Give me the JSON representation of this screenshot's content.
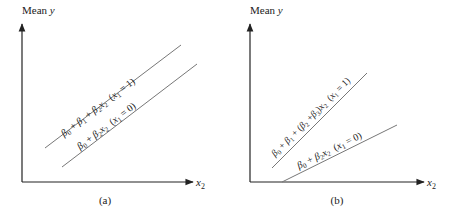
{
  "panels": [
    {
      "id": "a",
      "caption": "(a)",
      "y_axis_label": "Mean",
      "y_axis_var": "y",
      "x_axis_var": "x",
      "x_axis_sub": "2",
      "lines": [
        {
          "name": "x1-equals-1",
          "label_parts": [
            "β",
            "0",
            " + ",
            "β",
            "1",
            " + ",
            "β",
            "2",
            "x",
            "2",
            "  (",
            "x",
            "1",
            " = 1)"
          ],
          "x1": 45,
          "y1": 148,
          "x2": 181,
          "y2": 45
        },
        {
          "name": "x1-equals-0",
          "label_parts": [
            "β",
            "0",
            " + ",
            "β",
            "2",
            "x",
            "2",
            "  (",
            "x",
            "1",
            " = 0)"
          ],
          "x1": 62,
          "y1": 167,
          "x2": 197,
          "y2": 64
        }
      ]
    },
    {
      "id": "b",
      "caption": "(b)",
      "y_axis_label": "Mean",
      "y_axis_var": "y",
      "x_axis_var": "x",
      "x_axis_sub": "2",
      "lines": [
        {
          "name": "x1-equals-1",
          "label_parts": [
            "β",
            "0",
            " + ",
            "β",
            "1",
            " + (",
            "β",
            "2",
            " +",
            "β",
            "3",
            ")",
            "x",
            "2",
            "  (",
            "x",
            "1",
            " = 1)"
          ],
          "x1": 272,
          "y1": 168,
          "x2": 367,
          "y2": 73
        },
        {
          "name": "x1-equals-0",
          "label_parts": [
            "β",
            "0",
            " + ",
            "β",
            "2",
            "x",
            "2",
            "  (",
            "x",
            "1",
            " = 0)"
          ],
          "x1": 282,
          "y1": 182,
          "x2": 397,
          "y2": 125
        }
      ]
    }
  ],
  "labels": {
    "a_upper": {
      "b0": "β",
      "s0": "0",
      "plus1": " + ",
      "b1": "β",
      "s1": "1",
      "plus2": " + ",
      "b2": "β",
      "s2": "2",
      "x": "x",
      "sx": "2",
      "cond_open": "  (",
      "cx": "x",
      "csub": "1",
      "cond_close": " = 1)"
    },
    "a_lower": {
      "b0": "β",
      "s0": "0",
      "plus1": " + ",
      "b2": "β",
      "s2": "2",
      "x": "x",
      "sx": "2",
      "cond_open": "  (",
      "cx": "x",
      "csub": "1",
      "cond_close": " = 0)"
    },
    "b_upper": {
      "b0": "β",
      "s0": "0",
      "plus1": " + ",
      "b1": "β",
      "s1": "1",
      "plus2": " + (",
      "b2": "β",
      "s2": "2",
      "plus3": " +",
      "b3": "β",
      "s3": "3",
      "paren": ")",
      "x": "x",
      "sx": "2",
      "cond_open": "  (",
      "cx": "x",
      "csub": "1",
      "cond_close": " = 1)"
    },
    "b_lower": {
      "b0": "β",
      "s0": "0",
      "plus1": " + ",
      "b2": "β",
      "s2": "2",
      "x": "x",
      "sx": "2",
      "cond_open": "  (",
      "cx": "x",
      "csub": "1",
      "cond_close": " = 0)"
    },
    "mean": "Mean",
    "y": "y",
    "x": "x",
    "x_sub": "2",
    "caption_a": "(a)",
    "caption_b": "(b)"
  },
  "colors": {
    "axis": "#222222",
    "line": "#777777",
    "text": "#222222"
  }
}
